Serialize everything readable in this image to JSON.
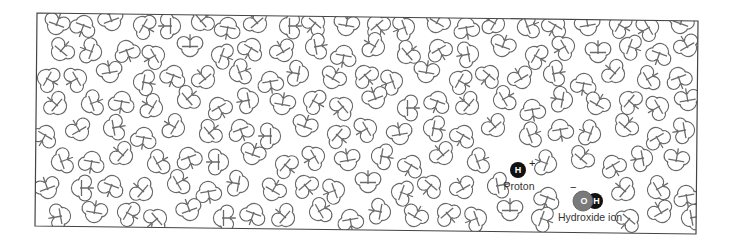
{
  "diagram": {
    "title": "",
    "frame": {
      "points": [
        [
          37,
          13
        ],
        [
          698,
          21
        ],
        [
          696,
          234
        ],
        [
          35,
          226
        ]
      ],
      "stroke": "#444444"
    },
    "molecule_stroke": "#6a6a6a",
    "water_molecule": {
      "o_radius": 8.5,
      "h_radius": 6.5,
      "h_offset": 8.0,
      "h_angle_deg": 104.5
    },
    "proton": {
      "symbol": "H",
      "charge": "+",
      "label": "Proton",
      "center": [
        518,
        170
      ],
      "radius": 8,
      "fill": "#111111"
    },
    "hydroxide": {
      "o_symbol": "O",
      "h_symbol": "H",
      "charge": "−",
      "label": "Hydroxide ion",
      "o_center": [
        583,
        201
      ],
      "o_radius": 10,
      "o_fill": "#7a7a7a",
      "h_center": [
        595,
        201
      ],
      "h_radius": 8,
      "h_fill": "#111111"
    },
    "waters": [
      [
        56,
        26,
        200
      ],
      [
        84,
        24,
        20
      ],
      [
        112,
        22,
        160
      ],
      [
        142,
        25,
        300
      ],
      [
        172,
        26,
        90
      ],
      [
        200,
        22,
        230
      ],
      [
        228,
        26,
        10
      ],
      [
        258,
        24,
        140
      ],
      [
        288,
        26,
        270
      ],
      [
        316,
        22,
        40
      ],
      [
        346,
        27,
        190
      ],
      [
        376,
        24,
        320
      ],
      [
        406,
        27,
        70
      ],
      [
        436,
        24,
        210
      ],
      [
        466,
        26,
        350
      ],
      [
        496,
        24,
        120
      ],
      [
        526,
        27,
        250
      ],
      [
        556,
        24,
        30
      ],
      [
        588,
        27,
        170
      ],
      [
        618,
        24,
        300
      ],
      [
        650,
        27,
        60
      ],
      [
        680,
        25,
        200
      ],
      [
        60,
        52,
        220
      ],
      [
        93,
        52,
        110
      ],
      [
        126,
        49,
        340
      ],
      [
        156,
        55,
        60
      ],
      [
        190,
        48,
        180
      ],
      [
        220,
        55,
        290
      ],
      [
        252,
        47,
        30
      ],
      [
        284,
        53,
        150
      ],
      [
        314,
        47,
        260
      ],
      [
        344,
        54,
        10
      ],
      [
        376,
        47,
        120
      ],
      [
        406,
        55,
        230
      ],
      [
        438,
        48,
        330
      ],
      [
        470,
        54,
        80
      ],
      [
        502,
        48,
        200
      ],
      [
        534,
        55,
        300
      ],
      [
        566,
        46,
        60
      ],
      [
        598,
        54,
        180
      ],
      [
        628,
        46,
        290
      ],
      [
        660,
        52,
        20
      ],
      [
        688,
        48,
        150
      ],
      [
        46,
        78,
        300
      ],
      [
        78,
        78,
        60
      ],
      [
        110,
        74,
        170
      ],
      [
        142,
        82,
        280
      ],
      [
        174,
        74,
        20
      ],
      [
        206,
        80,
        140
      ],
      [
        238,
        73,
        250
      ],
      [
        270,
        80,
        350
      ],
      [
        300,
        74,
        100
      ],
      [
        332,
        80,
        210
      ],
      [
        364,
        74,
        320
      ],
      [
        394,
        81,
        70
      ],
      [
        426,
        74,
        190
      ],
      [
        458,
        80,
        300
      ],
      [
        490,
        74,
        40
      ],
      [
        522,
        80,
        150
      ],
      [
        552,
        74,
        260
      ],
      [
        584,
        82,
        10
      ],
      [
        616,
        74,
        130
      ],
      [
        646,
        80,
        240
      ],
      [
        678,
        76,
        340
      ],
      [
        58,
        106,
        130
      ],
      [
        90,
        104,
        250
      ],
      [
        122,
        100,
        10
      ],
      [
        154,
        108,
        120
      ],
      [
        186,
        100,
        230
      ],
      [
        218,
        106,
        330
      ],
      [
        250,
        100,
        80
      ],
      [
        282,
        106,
        190
      ],
      [
        312,
        100,
        300
      ],
      [
        344,
        106,
        50
      ],
      [
        376,
        100,
        160
      ],
      [
        406,
        108,
        270
      ],
      [
        438,
        100,
        20
      ],
      [
        470,
        106,
        130
      ],
      [
        502,
        100,
        240
      ],
      [
        532,
        108,
        350
      ],
      [
        564,
        100,
        100
      ],
      [
        596,
        106,
        210
      ],
      [
        628,
        100,
        310
      ],
      [
        660,
        106,
        60
      ],
      [
        688,
        102,
        170
      ],
      [
        46,
        134,
        30
      ],
      [
        80,
        132,
        150
      ],
      [
        112,
        128,
        260
      ],
      [
        144,
        136,
        10
      ],
      [
        176,
        128,
        120
      ],
      [
        208,
        134,
        230
      ],
      [
        240,
        128,
        340
      ],
      [
        272,
        136,
        90
      ],
      [
        304,
        128,
        200
      ],
      [
        336,
        134,
        310
      ],
      [
        368,
        128,
        60
      ],
      [
        400,
        136,
        170
      ],
      [
        432,
        128,
        280
      ],
      [
        464,
        134,
        30
      ],
      [
        496,
        128,
        140
      ],
      [
        528,
        136,
        250
      ],
      [
        560,
        128,
        350
      ],
      [
        592,
        134,
        110
      ],
      [
        624,
        128,
        220
      ],
      [
        656,
        136,
        330
      ],
      [
        686,
        130,
        80
      ],
      [
        60,
        162,
        250
      ],
      [
        92,
        160,
        10
      ],
      [
        124,
        156,
        130
      ],
      [
        156,
        164,
        240
      ],
      [
        188,
        156,
        340
      ],
      [
        220,
        162,
        90
      ],
      [
        252,
        156,
        200
      ],
      [
        284,
        164,
        310
      ],
      [
        316,
        156,
        60
      ],
      [
        348,
        162,
        170
      ],
      [
        380,
        156,
        280
      ],
      [
        412,
        164,
        30
      ],
      [
        444,
        156,
        140
      ],
      [
        476,
        162,
        250
      ],
      [
        548,
        164,
        110
      ],
      [
        580,
        160,
        220
      ],
      [
        612,
        164,
        330
      ],
      [
        644,
        158,
        80
      ],
      [
        676,
        162,
        190
      ],
      [
        48,
        190,
        160
      ],
      [
        80,
        188,
        270
      ],
      [
        112,
        184,
        20
      ],
      [
        144,
        192,
        130
      ],
      [
        176,
        184,
        240
      ],
      [
        208,
        190,
        350
      ],
      [
        240,
        184,
        100
      ],
      [
        272,
        192,
        210
      ],
      [
        304,
        184,
        320
      ],
      [
        336,
        190,
        70
      ],
      [
        368,
        184,
        180
      ],
      [
        400,
        192,
        290
      ],
      [
        432,
        184,
        40
      ],
      [
        464,
        190,
        150
      ],
      [
        496,
        186,
        260
      ],
      [
        548,
        196,
        20
      ],
      [
        626,
        192,
        130
      ],
      [
        656,
        190,
        240
      ],
      [
        686,
        194,
        350
      ],
      [
        62,
        216,
        80
      ],
      [
        94,
        214,
        190
      ],
      [
        126,
        212,
        300
      ],
      [
        158,
        218,
        50
      ],
      [
        190,
        212,
        160
      ],
      [
        222,
        218,
        270
      ],
      [
        254,
        212,
        20
      ],
      [
        286,
        218,
        130
      ],
      [
        318,
        212,
        240
      ],
      [
        350,
        218,
        350
      ],
      [
        382,
        212,
        100
      ],
      [
        414,
        218,
        210
      ],
      [
        446,
        212,
        320
      ],
      [
        478,
        218,
        70
      ],
      [
        510,
        212,
        180
      ],
      [
        540,
        218,
        290
      ],
      [
        630,
        218,
        40
      ],
      [
        662,
        214,
        150
      ],
      [
        690,
        218,
        260
      ]
    ]
  }
}
